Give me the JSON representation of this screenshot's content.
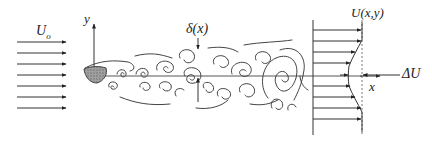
{
  "figure": {
    "type": "turbulent wake / shear layer schematic",
    "labels": {
      "freestream_velocity": "U",
      "freestream_subscript": "o",
      "y_axis": "y",
      "x_axis": "x",
      "thickness": "δ(x)",
      "velocity_profile": "U(x,y)",
      "velocity_deficit": "ΔU"
    },
    "colors": {
      "stroke": "#333333",
      "body_fill": "#9a9a9a",
      "background": "#ffffff"
    },
    "incoming_arrows_count": 7,
    "profile_arrows_count": 9
  }
}
